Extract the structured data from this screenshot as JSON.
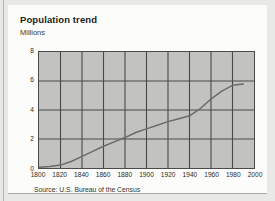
{
  "figure": {
    "title": "Population trend",
    "subtitle": "Millions",
    "source": "Source: U.S. Bureau of the Census"
  },
  "colors": {
    "plot_background": "#c2c2c0",
    "card_background": "#fcfcfa",
    "page_background": "#e9e9e7",
    "axis_line": "#4a4a48",
    "gridline": "#4a4a48",
    "series_line": "#6b6b69",
    "title_text": "#1d1d1b",
    "label_text": "#2b2b29"
  },
  "chart_data": {
    "type": "line",
    "title": "Population trend",
    "subtitle": "Millions",
    "xlabel": "",
    "ylabel": "Millions",
    "xlim": [
      1800,
      2000
    ],
    "ylim": [
      0,
      8
    ],
    "x_ticks": [
      1800,
      1820,
      1840,
      1860,
      1880,
      1900,
      1920,
      1940,
      1960,
      1980,
      2000
    ],
    "y_ticks": [
      0,
      2,
      4,
      6,
      8
    ],
    "grid": true,
    "legend": null,
    "series": [
      {
        "name": "Population",
        "x": [
          1800,
          1810,
          1820,
          1830,
          1840,
          1850,
          1860,
          1870,
          1880,
          1890,
          1900,
          1910,
          1920,
          1930,
          1940,
          1950,
          1960,
          1970,
          1980,
          1990
        ],
        "values": [
          0.05,
          0.1,
          0.2,
          0.45,
          0.8,
          1.15,
          1.5,
          1.8,
          2.1,
          2.45,
          2.7,
          2.95,
          3.2,
          3.4,
          3.6,
          4.1,
          4.75,
          5.3,
          5.7,
          5.8
        ]
      }
    ],
    "source": "Source: U.S. Bureau of the Census"
  }
}
